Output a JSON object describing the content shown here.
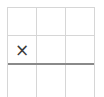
{
  "board": {
    "rows": 3,
    "cols": 3,
    "cells": [
      [
        "",
        "",
        ""
      ],
      [
        "×",
        "",
        ""
      ],
      [
        "",
        "",
        ""
      ]
    ]
  },
  "colors": {
    "grid_line": "#d6d6d6",
    "divider_line": "#8a8a8a",
    "mark": "#3a3a3a",
    "background": "#ffffff"
  }
}
